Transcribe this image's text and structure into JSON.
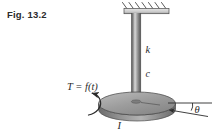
{
  "figure": {
    "caption": "Fig. 13.2",
    "background_color": "#ffffff",
    "ink_color": "#2b2b2b"
  },
  "labels": {
    "stiffness": "k",
    "damping": "c",
    "inertia": "I",
    "torque": "T = f(t)",
    "angle": "θ"
  },
  "parts": {
    "ceiling_support": "hatched-fixed-support",
    "shaft": "vertical-shaft",
    "disk": "rotating-disk",
    "torque_arrow": "curved-torque-arrow",
    "angle_arc": "angle-arc",
    "reference_line": "horizontal-reference-line",
    "angle_arrow": "angle-indicator-arrow"
  },
  "colors": {
    "metal_dark": "#6e6e6e",
    "metal_mid": "#9a9a9a",
    "metal_light": "#d2d2d2",
    "disk_top": "#9d9d9d",
    "disk_edge": "#7a7a7a",
    "outline": "#3a3a3a"
  }
}
